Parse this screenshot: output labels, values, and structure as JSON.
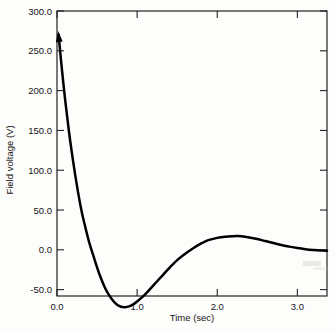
{
  "chart_data": {
    "type": "line",
    "title": "",
    "xlabel": "Time (sec)",
    "ylabel": "Field voltage (V)",
    "xlim": [
      0.0,
      3.37
    ],
    "ylim": [
      -58.0,
      300.0
    ],
    "xticks": [
      0.0,
      1.0,
      2.0,
      3.0
    ],
    "xticklabels": [
      "0.0",
      "1.0",
      "2.0",
      "3.0"
    ],
    "yticks": [
      -50.0,
      0.0,
      50.0,
      100.0,
      150.0,
      200.0,
      250.0,
      300.0
    ],
    "yticklabels": [
      "-50.0",
      "0.0",
      "50.0",
      "100.0",
      "150.0",
      "200.0",
      "250.0",
      "300.0"
    ],
    "grid": false,
    "legend": null,
    "annotations": [
      {
        "name": "start-arrow",
        "x": 0.02,
        "y": 270.0,
        "note": "arrowhead marking initial field voltage transient"
      }
    ],
    "series": [
      {
        "name": "Field voltage",
        "color": "#000000",
        "x": [
          0.02,
          0.05,
          0.1,
          0.15,
          0.2,
          0.25,
          0.3,
          0.34,
          0.4,
          0.45,
          0.5,
          0.55,
          0.6,
          0.65,
          0.7,
          0.75,
          0.8,
          0.85,
          0.9,
          0.95,
          1.0,
          1.1,
          1.2,
          1.3,
          1.4,
          1.5,
          1.6,
          1.7,
          1.8,
          1.85,
          1.9,
          2.0,
          2.1,
          2.2,
          2.25,
          2.3,
          2.4,
          2.5,
          2.6,
          2.7,
          2.8,
          2.9,
          3.0,
          3.1,
          3.2,
          3.3,
          3.37
        ],
        "y": [
          270.0,
          238.0,
          190.0,
          148.0,
          112.0,
          80.0,
          52.0,
          34.0,
          10.0,
          -6.0,
          -22.0,
          -36.0,
          -48.0,
          -57.0,
          -64.0,
          -69.0,
          -71.5,
          -72.0,
          -71.0,
          -68.5,
          -65.0,
          -56.0,
          -45.0,
          -34.0,
          -23.0,
          -13.0,
          -5.0,
          2.0,
          8.0,
          10.5,
          12.5,
          15.0,
          16.5,
          17.2,
          17.3,
          17.0,
          15.5,
          13.5,
          11.0,
          8.5,
          6.0,
          4.0,
          2.2,
          0.8,
          -0.2,
          -0.9,
          -1.2
        ]
      }
    ]
  },
  "axes": {
    "x_axis_label": "Time (sec)",
    "y_axis_label": "Field voltage (V)"
  }
}
